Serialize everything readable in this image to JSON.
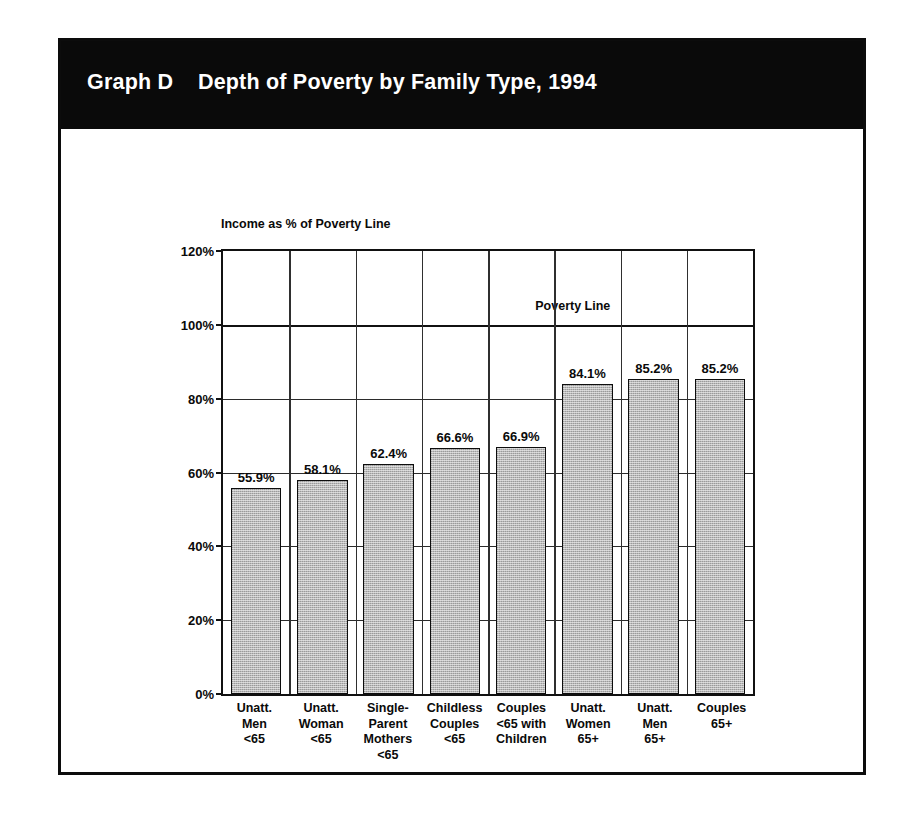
{
  "banner": {
    "title": "Graph D    Depth of Poverty by Family Type, 1994"
  },
  "chart_data": {
    "type": "bar",
    "title": "Depth of Poverty by Family Type, 1994",
    "xlabel": "",
    "ylabel": "Income as % of Poverty Line",
    "ylim": [
      0,
      120
    ],
    "ytick_labels": [
      "0%",
      "20%",
      "40%",
      "60%",
      "80%",
      "100%",
      "120%"
    ],
    "ytick_values": [
      0,
      20,
      40,
      60,
      80,
      100,
      120
    ],
    "grid": true,
    "legend": "none",
    "categories": [
      "Unatt. Men <65",
      "Unatt. Woman <65",
      "Single-Parent Mothers <65",
      "Childless Couples <65",
      "Couples <65 with Children",
      "Unatt. Women 65+",
      "Unatt. Men 65+",
      "Couples 65+"
    ],
    "category_lines": [
      [
        "Unatt.",
        "Men",
        "<65"
      ],
      [
        "Unatt.",
        "Woman",
        "<65"
      ],
      [
        "Single-",
        "Parent",
        "Mothers",
        "<65"
      ],
      [
        "Childless",
        "Couples",
        "<65"
      ],
      [
        "Couples",
        "<65 with",
        "Children"
      ],
      [
        "Unatt.",
        "Women",
        "65+"
      ],
      [
        "Unatt.",
        "Men",
        "65+"
      ],
      [
        "Couples",
        "65+"
      ]
    ],
    "values": [
      55.9,
      58.1,
      62.4,
      66.6,
      66.9,
      84.1,
      85.2,
      85.2
    ],
    "value_labels": [
      "55.9%",
      "58.1%",
      "62.4%",
      "66.6%",
      "66.9%",
      "84.1%",
      "85.2%",
      "85.2%"
    ],
    "annotations": [
      {
        "text": "Poverty Line",
        "y_value": 100
      }
    ],
    "bar_color": "#b9b9b9",
    "bar_border_color": "#0d0d0d"
  }
}
